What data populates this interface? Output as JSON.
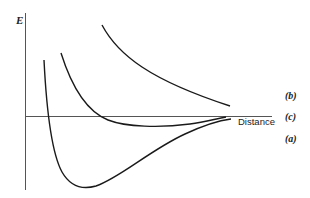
{
  "diagram": {
    "y_axis_label": "E",
    "x_axis_label": "Distance",
    "curve_labels": {
      "b": "(b)",
      "c": "(c)",
      "a": "(a)"
    },
    "colors": {
      "curve": "#1a1a1a",
      "axis": "#555555",
      "background": "#ffffff"
    }
  }
}
